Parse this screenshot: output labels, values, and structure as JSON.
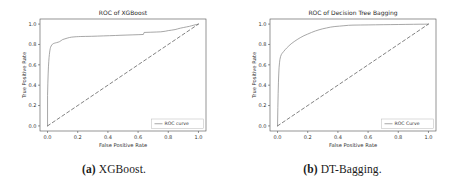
{
  "figure": {
    "background": "#ffffff",
    "line_color": "#8a8a8a",
    "axis_color": "#4d4d4d",
    "subfigures": [
      {
        "caption_tag": "(a)",
        "caption_text": " XGBoost."
      },
      {
        "caption_tag": "(b)",
        "caption_text": " DT-Bagging."
      }
    ]
  },
  "chart_data": [
    {
      "type": "line",
      "title": "ROC of XGBoost",
      "xlabel": "False Positive Rate",
      "ylabel": "True Positive Rate",
      "xlim": [
        -0.05,
        1.05
      ],
      "ylim": [
        -0.05,
        1.05
      ],
      "xticks": [
        "0.0",
        "0.2",
        "0.4",
        "0.6",
        "0.8",
        "1.0"
      ],
      "yticks": [
        "0.0",
        "0.2",
        "0.4",
        "0.6",
        "0.8",
        "1.0"
      ],
      "xtick_values": [
        0.0,
        0.2,
        0.4,
        0.6,
        0.8,
        1.0
      ],
      "ytick_values": [
        0.0,
        0.2,
        0.4,
        0.6,
        0.8,
        1.0
      ],
      "grid": false,
      "legend_position": "lower right",
      "series": [
        {
          "name": "ROC curve",
          "style": "solid",
          "color": "#8a8a8a",
          "x": [
            0.0,
            0.0,
            0.002,
            0.004,
            0.006,
            0.008,
            0.01,
            0.012,
            0.014,
            0.016,
            0.018,
            0.02,
            0.024,
            0.028,
            0.032,
            0.038,
            0.045,
            0.052,
            0.06,
            0.07,
            0.08,
            0.09,
            0.1,
            0.115,
            0.13,
            0.145,
            0.16,
            0.175,
            0.19,
            0.205,
            0.22,
            0.25,
            0.29,
            0.33,
            0.37,
            0.41,
            0.45,
            0.48,
            0.52,
            0.56,
            0.6,
            0.635,
            0.64,
            0.68,
            0.72,
            0.75,
            0.78,
            0.8,
            0.82,
            0.845,
            0.86,
            0.88,
            0.9,
            0.92,
            0.94,
            0.955,
            0.97,
            0.985,
            1.0
          ],
          "y": [
            0.0,
            0.3,
            0.42,
            0.51,
            0.58,
            0.63,
            0.67,
            0.7,
            0.725,
            0.745,
            0.76,
            0.772,
            0.785,
            0.795,
            0.802,
            0.808,
            0.812,
            0.815,
            0.818,
            0.822,
            0.828,
            0.838,
            0.848,
            0.855,
            0.862,
            0.868,
            0.872,
            0.874,
            0.876,
            0.877,
            0.878,
            0.879,
            0.88,
            0.882,
            0.884,
            0.886,
            0.888,
            0.89,
            0.892,
            0.894,
            0.896,
            0.898,
            0.918,
            0.92,
            0.922,
            0.924,
            0.93,
            0.936,
            0.94,
            0.946,
            0.952,
            0.96,
            0.966,
            0.972,
            0.978,
            0.984,
            0.99,
            0.995,
            1.0
          ]
        },
        {
          "name": "chance-diagonal",
          "style": "dashed",
          "color": "#4d4d4d",
          "x": [
            0.0,
            1.0
          ],
          "y": [
            0.0,
            1.0
          ]
        }
      ],
      "legend_entries": [
        "ROC curve"
      ]
    },
    {
      "type": "line",
      "title": "ROC of Decision Tree Bagging",
      "xlabel": "False Positive Rate",
      "ylabel": "True Positive Rate",
      "xlim": [
        -0.05,
        1.05
      ],
      "ylim": [
        -0.05,
        1.05
      ],
      "xticks": [
        "0.0",
        "0.2",
        "0.4",
        "0.6",
        "0.8",
        "1.0"
      ],
      "yticks": [
        "0.0",
        "0.2",
        "0.4",
        "0.6",
        "0.8",
        "1.0"
      ],
      "xtick_values": [
        0.0,
        0.2,
        0.4,
        0.6,
        0.8,
        1.0
      ],
      "ytick_values": [
        0.0,
        0.2,
        0.4,
        0.6,
        0.8,
        1.0
      ],
      "grid": false,
      "legend_position": "lower right",
      "series": [
        {
          "name": "ROC Curve",
          "style": "solid",
          "color": "#8a8a8a",
          "x": [
            0.0,
            0.002,
            0.004,
            0.006,
            0.008,
            0.01,
            0.013,
            0.016,
            0.02,
            0.025,
            0.03,
            0.04,
            0.05,
            0.06,
            0.075,
            0.09,
            0.11,
            0.13,
            0.15,
            0.175,
            0.2,
            0.225,
            0.25,
            0.275,
            0.3,
            0.325,
            0.35,
            0.38,
            0.41,
            0.44,
            0.47,
            0.5,
            0.55,
            0.6,
            0.65,
            0.7,
            0.75,
            0.8,
            0.85,
            0.9,
            0.95,
            0.975,
            1.0
          ],
          "y": [
            0.0,
            0.18,
            0.32,
            0.43,
            0.51,
            0.57,
            0.62,
            0.655,
            0.68,
            0.7,
            0.712,
            0.73,
            0.748,
            0.764,
            0.786,
            0.806,
            0.828,
            0.848,
            0.866,
            0.886,
            0.902,
            0.918,
            0.932,
            0.944,
            0.954,
            0.962,
            0.97,
            0.976,
            0.98,
            0.984,
            0.988,
            0.99,
            0.991,
            0.992,
            0.993,
            0.994,
            0.995,
            0.996,
            0.997,
            0.998,
            0.999,
            0.999,
            1.0
          ]
        },
        {
          "name": "chance-diagonal",
          "style": "dashed",
          "color": "#4d4d4d",
          "x": [
            0.0,
            1.0
          ],
          "y": [
            0.0,
            1.0
          ]
        }
      ],
      "legend_entries": [
        "ROC Curve"
      ]
    }
  ]
}
